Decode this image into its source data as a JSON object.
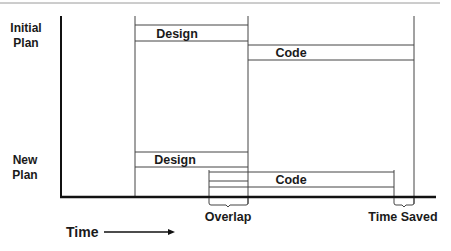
{
  "diagram": {
    "type": "timeline-comparison",
    "row_labels": {
      "initial_plan": [
        "Initial",
        "Plan"
      ],
      "new_plan": [
        "New",
        "Plan"
      ]
    },
    "initial_plan": {
      "design": {
        "label": "Design",
        "start": 135,
        "end": 248
      },
      "code": {
        "label": "Code",
        "start": 248,
        "end": 414
      }
    },
    "new_plan": {
      "design": {
        "label": "Design",
        "start": 135,
        "end": 248
      },
      "code": {
        "label": "Code",
        "start": 209,
        "end": 394
      }
    },
    "annotations": {
      "overlap": "Overlap",
      "time_saved": "Time Saved"
    },
    "axis": {
      "label": "Time"
    },
    "colors": {
      "line": "#333333",
      "axis": "#111111",
      "text": "#1a1a1a",
      "top_rule": "#9a9a9a"
    }
  }
}
